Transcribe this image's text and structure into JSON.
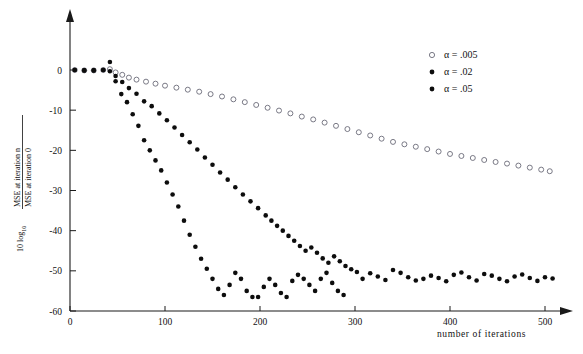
{
  "figure": {
    "name": "mse-convergence-plot",
    "background_color": "#ffffff",
    "ink_color": "#111111"
  },
  "axes": {
    "x": {
      "label": "number of  iterations",
      "ticks": [
        0,
        100,
        200,
        300,
        400,
        500
      ],
      "tick_labels": [
        "0",
        "100",
        "200",
        "300",
        "400",
        "500"
      ],
      "min": 0,
      "max": 520,
      "arrow": true
    },
    "y": {
      "label_prefix": "10 log",
      "label_subscript": "10",
      "label_numerator": "MSE at iteration n",
      "label_denominator": "MSE at iteration 0",
      "ticks": [
        0,
        -10,
        -20,
        -30,
        -40,
        -50,
        -60
      ],
      "tick_labels": [
        "0",
        "-10",
        "-20",
        "-30",
        "-40",
        "-50",
        "-60"
      ],
      "min": -60,
      "max": 5,
      "arrow": true
    }
  },
  "legend": {
    "position": "top-right",
    "entries": [
      {
        "marker": "open-circle",
        "label": "α = .005",
        "color": "#6b6b78"
      },
      {
        "marker": "filled-circle",
        "label": "α = .02",
        "color": "#0d0d0d"
      },
      {
        "marker": "filled-circle",
        "label": "α = .05",
        "color": "#0d0d0d"
      }
    ]
  },
  "chart_data": {
    "type": "scatter",
    "title": "",
    "xlabel": "number of  iterations",
    "ylabel": "10 log10 ( MSE at iteration n / MSE at iteration 0 )",
    "xlim": [
      0,
      520
    ],
    "ylim": [
      -60,
      5
    ],
    "grid": false,
    "legend_position": "top-right",
    "series": [
      {
        "name": "α = .005",
        "marker": "open-circle",
        "color": "#6b6b78",
        "x": [
          5,
          15,
          25,
          35,
          42,
          48,
          55,
          62,
          70,
          80,
          90,
          100,
          112,
          124,
          136,
          148,
          160,
          172,
          184,
          196,
          208,
          220,
          232,
          244,
          256,
          268,
          280,
          292,
          304,
          316,
          328,
          340,
          352,
          364,
          376,
          388,
          400,
          412,
          424,
          436,
          448,
          460,
          472,
          484,
          496,
          505
        ],
        "y": [
          0.0,
          -0.1,
          -0.1,
          0.0,
          0.2,
          -0.6,
          -1.2,
          -1.9,
          -2.4,
          -2.9,
          -3.4,
          -3.9,
          -4.4,
          -4.9,
          -5.4,
          -6.0,
          -6.6,
          -7.3,
          -8.0,
          -8.7,
          -9.4,
          -10.1,
          -10.8,
          -11.6,
          -12.3,
          -13.1,
          -13.9,
          -14.7,
          -15.5,
          -16.3,
          -17.1,
          -17.9,
          -18.5,
          -19.1,
          -19.7,
          -20.3,
          -20.9,
          -21.4,
          -21.9,
          -22.4,
          -22.9,
          -23.3,
          -23.8,
          -24.3,
          -24.8,
          -25.2
        ]
      },
      {
        "name": "α = .02",
        "marker": "filled-circle",
        "color": "#0d0d0d",
        "x": [
          5,
          15,
          25,
          35,
          42,
          48,
          55,
          62,
          70,
          78,
          86,
          94,
          102,
          110,
          118,
          126,
          134,
          142,
          150,
          158,
          166,
          174,
          182,
          190,
          198,
          206,
          212,
          218,
          224,
          230,
          236,
          242,
          248,
          254,
          260,
          266,
          272,
          278,
          284,
          290,
          296,
          302,
          308,
          316,
          324,
          332,
          340,
          348,
          356,
          364,
          372,
          380,
          388,
          396,
          404,
          412,
          420,
          428,
          436,
          444,
          452,
          460,
          468,
          476,
          484,
          492,
          500,
          508
        ],
        "y": [
          0.0,
          -0.1,
          -0.1,
          0.0,
          2.0,
          -1.5,
          -3.0,
          -4.5,
          -5.9,
          -7.8,
          -9.0,
          -10.8,
          -12.5,
          -14.3,
          -16.2,
          -18.0,
          -19.8,
          -21.8,
          -23.6,
          -25.5,
          -27.3,
          -29.2,
          -31.0,
          -32.7,
          -34.4,
          -36.2,
          -37.5,
          -38.8,
          -40.0,
          -41.3,
          -42.5,
          -43.8,
          -45.0,
          -44.2,
          -45.5,
          -46.9,
          -48.0,
          -46.4,
          -47.6,
          -48.8,
          -49.6,
          -50.3,
          -52.0,
          -50.6,
          -51.4,
          -52.3,
          -49.8,
          -50.5,
          -51.6,
          -52.4,
          -52.0,
          -51.2,
          -51.8,
          -52.6,
          -51.0,
          -50.4,
          -51.6,
          -52.4,
          -50.8,
          -51.2,
          -52.0,
          -52.6,
          -51.4,
          -50.9,
          -51.8,
          -52.5,
          -51.6,
          -51.9
        ]
      },
      {
        "name": "α = .05",
        "marker": "filled-circle",
        "color": "#0d0d0d",
        "x": [
          5,
          15,
          25,
          35,
          42,
          48,
          54,
          60,
          66,
          72,
          78,
          84,
          90,
          96,
          102,
          108,
          114,
          120,
          126,
          132,
          138,
          144,
          150,
          156,
          162,
          168,
          174,
          180,
          186,
          192,
          198,
          204,
          210,
          216,
          222,
          228,
          234,
          240,
          246,
          252,
          258,
          264,
          270,
          276,
          282,
          288
        ],
        "y": [
          0.0,
          -0.1,
          -0.1,
          0.0,
          -0.3,
          -2.8,
          -6.0,
          -8.0,
          -11.0,
          -13.9,
          -17.5,
          -20.0,
          -22.5,
          -25.0,
          -28.0,
          -31.0,
          -34.0,
          -37.5,
          -41.0,
          -44.0,
          -47.0,
          -49.5,
          -52.0,
          -54.5,
          -56.0,
          -53.5,
          -50.5,
          -52.0,
          -55.0,
          -56.5,
          -56.5,
          -54.0,
          -52.0,
          -53.5,
          -55.5,
          -56.5,
          -52.5,
          -51.0,
          -52.0,
          -53.5,
          -55.0,
          -52.0,
          -50.5,
          -53.0,
          -55.0,
          -56.0
        ]
      }
    ]
  }
}
